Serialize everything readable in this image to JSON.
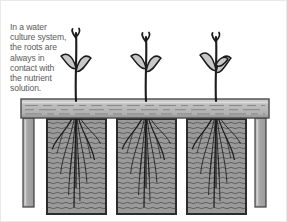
{
  "figure": {
    "caption": {
      "lines": [
        "In a water",
        "culture system,",
        "the roots are",
        "always in",
        "contact with",
        "the nutrient",
        "solution."
      ],
      "full_text": "In a water culture system, the roots are always in contact with the nutrient solution.",
      "color": "#5a5a5a"
    },
    "colors": {
      "background": "#ffffff",
      "board_fill": "#b4b4b4",
      "board_top": "#d2d2d2",
      "board_grain": "#8a8a8a",
      "board_outline": "#4a4a4a",
      "leg_fill": "#a8a8a8",
      "leg_highlight": "#c4c4c4",
      "leg_outline": "#3c3c3c",
      "tank_fill": "#9a9a9a",
      "tank_outline": "#2b2b2b",
      "water_wave": "#5e5e5e",
      "plant_stem": "#1c1c1c",
      "leaf_fill": "#c8c8c8",
      "leaf_outline": "#1c1c1c",
      "root": "#1c1c1c",
      "border": "#e9e9e9"
    },
    "support_board": {
      "label": "support-board",
      "x": 20,
      "y": 98,
      "width": 248,
      "height": 19,
      "grain_rows": 3
    },
    "legs": [
      {
        "label": "leg-left",
        "x": 22,
        "y": 117,
        "width": 11,
        "height": 89
      },
      {
        "label": "leg-right",
        "x": 254,
        "y": 117,
        "width": 11,
        "height": 89
      }
    ],
    "tanks": [
      {
        "label": "nutrient-tank-1",
        "x": 46,
        "y": 118,
        "width": 59,
        "height": 95
      },
      {
        "label": "nutrient-tank-2",
        "x": 116,
        "y": 118,
        "width": 59,
        "height": 95
      },
      {
        "label": "nutrient-tank-3",
        "x": 186,
        "y": 118,
        "width": 59,
        "height": 95
      }
    ],
    "plants": [
      {
        "label": "plant-1",
        "stem_x": 75,
        "top_y": 32,
        "leaf_count": 2
      },
      {
        "label": "plant-2",
        "stem_x": 145,
        "top_y": 36,
        "leaf_count": 2
      },
      {
        "label": "plant-3",
        "stem_x": 215,
        "top_y": 36,
        "leaf_count": 3
      }
    ],
    "root_systems": [
      {
        "label": "root-system-1",
        "origin_x": 75,
        "origin_y": 118,
        "depth": 88
      },
      {
        "label": "root-system-2",
        "origin_x": 145,
        "origin_y": 118,
        "depth": 88
      },
      {
        "label": "root-system-3",
        "origin_x": 215,
        "origin_y": 118,
        "depth": 88
      }
    ],
    "water": {
      "label": "nutrient-solution",
      "wave_spacing": 5,
      "wave_amplitude": 1.3
    }
  }
}
